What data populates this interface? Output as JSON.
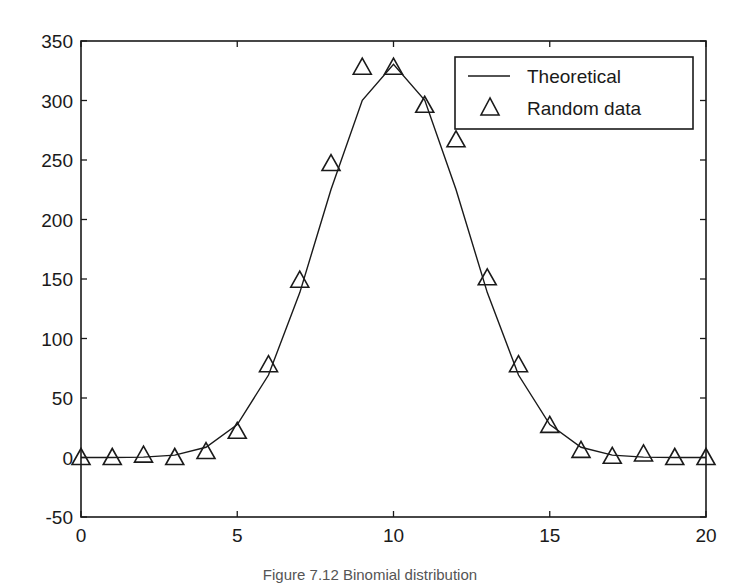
{
  "chart_data": {
    "type": "line",
    "title": "",
    "xlabel": "",
    "ylabel": "",
    "xlim": [
      0,
      20
    ],
    "ylim": [
      -50,
      350
    ],
    "x_ticks": [
      0,
      5,
      10,
      15,
      20
    ],
    "y_ticks": [
      -50,
      0,
      50,
      100,
      150,
      200,
      250,
      300,
      350
    ],
    "grid": false,
    "legend_position": "upper right",
    "x": [
      0,
      1,
      2,
      3,
      4,
      5,
      6,
      7,
      8,
      9,
      10,
      11,
      12,
      13,
      14,
      15,
      16,
      17,
      18,
      19,
      20
    ],
    "series": [
      {
        "name": "Theoretical",
        "style": "line",
        "values": [
          0,
          0.04,
          0.34,
          2.0,
          8.6,
          27.7,
          69.3,
          138.6,
          225.2,
          300.2,
          330.3,
          300.2,
          225.2,
          138.6,
          69.3,
          27.7,
          8.6,
          2.0,
          0.34,
          0.04,
          0
        ]
      },
      {
        "name": "Random data",
        "style": "triangle-marker",
        "values": [
          0,
          0,
          2,
          0,
          5,
          22,
          78,
          149,
          247,
          328,
          328,
          296,
          267,
          151,
          78,
          27,
          6,
          1,
          3,
          0,
          0
        ]
      }
    ],
    "caption": "Figure 7.12  Binomial distribution"
  },
  "legend": {
    "items": [
      {
        "label": "Theoretical",
        "symbol": "line"
      },
      {
        "label": "Random data",
        "symbol": "triangle"
      }
    ]
  },
  "colors": {
    "line": "#1a1a1a",
    "axes": "#1a1a1a",
    "background": "#ffffff"
  }
}
